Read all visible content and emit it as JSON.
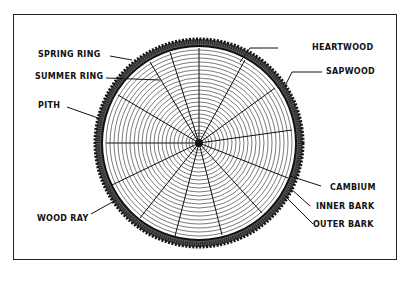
{
  "diagram": {
    "center": [
      199,
      143
    ],
    "labels": {
      "spring_ring": "SPRING RING",
      "summer_ring": "SUMMER RING",
      "pith": "PITH",
      "wood_ray": "WOOD RAY",
      "heartwood": "HEARTWOOD",
      "sapwood": "SAPWOOD",
      "cambium": "CAMBIUM",
      "inner_bark": "INNER BARK",
      "outer_bark": "OUTER BARK"
    },
    "colors": {
      "ink": "#111111",
      "background": "#ffffff"
    }
  }
}
